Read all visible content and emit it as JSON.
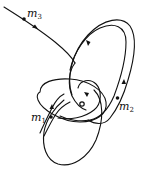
{
  "diagram": {
    "type": "three-body-orbits",
    "stroke_color": "#111111",
    "background": "#ffffff",
    "bodies": [
      {
        "id": "m1",
        "label": "m",
        "subscript": "1"
      },
      {
        "id": "m2",
        "label": "m",
        "subscript": "2"
      },
      {
        "id": "m3",
        "label": "m",
        "subscript": "3"
      }
    ],
    "center_marker": "small-circle"
  }
}
